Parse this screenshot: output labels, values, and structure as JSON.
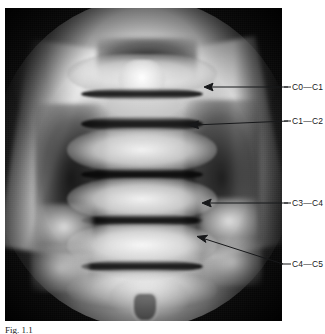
{
  "figure": {
    "modality": "x-ray-radiograph",
    "view": "open-mouth anteroposterior cervical spine",
    "caption_label": "Fig.",
    "caption_number": "1.1",
    "caption_text": "Fig. 1.1"
  },
  "annotations": [
    {
      "id": "c0-c1",
      "label": "C0—C1",
      "arrow": "left-arrow-icon"
    },
    {
      "id": "c1-c2",
      "label": "C1—C2",
      "arrow": "left-arrow-icon"
    },
    {
      "id": "c3-c4",
      "label": "C3—C4",
      "arrow": "left-arrow-icon"
    },
    {
      "id": "c4-c5",
      "label": "C4—C5",
      "arrow": "left-arrow-icon"
    }
  ],
  "colors": {
    "page_background": "#ffffff",
    "film_background": "#121212",
    "annotation_ink": "#17181a",
    "bone_highlight": "#fafafa"
  }
}
